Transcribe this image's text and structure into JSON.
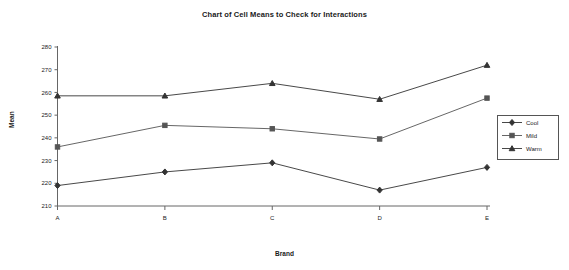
{
  "chart_data": {
    "type": "line",
    "title": "Chart of Cell Means to Check for Interactions",
    "xlabel": "Brand",
    "ylabel": "Mean",
    "categories": [
      "A",
      "B",
      "C",
      "D",
      "E"
    ],
    "ylim": [
      210,
      280
    ],
    "yticks": [
      210,
      220,
      230,
      240,
      250,
      260,
      270,
      280
    ],
    "grid": false,
    "legend_position": "right",
    "series": [
      {
        "name": "Cool",
        "marker": "diamond",
        "color": "#333333",
        "values": [
          219,
          225,
          229,
          217,
          227
        ]
      },
      {
        "name": "Mild",
        "marker": "square",
        "color": "#555555",
        "values": [
          236,
          245.5,
          244,
          239.5,
          257.5
        ]
      },
      {
        "name": "Warm",
        "marker": "triangle",
        "color": "#333333",
        "values": [
          258.5,
          258.5,
          264,
          257,
          272
        ]
      }
    ]
  },
  "axis": {
    "y_tick_labels": [
      "280",
      "270",
      "260",
      "250",
      "240",
      "230",
      "220",
      "210"
    ],
    "x_tick_labels": [
      "A",
      "B",
      "C",
      "D",
      "E"
    ]
  },
  "legend": {
    "entries": [
      {
        "label": "Cool"
      },
      {
        "label": "Mild"
      },
      {
        "label": "Warm"
      }
    ]
  },
  "colors": {
    "axis": "#666666",
    "line": "#444444",
    "text": "#1a1a1a",
    "background": "#ffffff"
  }
}
